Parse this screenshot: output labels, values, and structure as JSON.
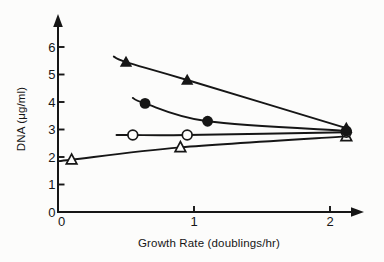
{
  "figure": {
    "background": "#fcfcfb",
    "ink": "#161616"
  },
  "chart_data": {
    "type": "line",
    "title": "",
    "xlabel": "Growth Rate (doublings/hr)",
    "ylabel": "DNA (μg/ml)",
    "xlim": [
      0,
      2.28
    ],
    "ylim": [
      0,
      6.9
    ],
    "x_ticks": [
      0,
      1,
      2
    ],
    "y_ticks": [
      0,
      1,
      2,
      3,
      4,
      5,
      6
    ],
    "grid": false,
    "legend": "none",
    "axis_arrows": true,
    "series": [
      {
        "name": "open-triangle",
        "marker": "triangle-open",
        "line_start": [
          0.0,
          1.85
        ],
        "points": [
          [
            0.1,
            1.9
          ],
          [
            0.9,
            2.35
          ],
          [
            2.12,
            2.75
          ]
        ]
      },
      {
        "name": "open-circle",
        "marker": "circle-open",
        "line_start": [
          0.43,
          2.8
        ],
        "points": [
          [
            0.55,
            2.8
          ],
          [
            0.95,
            2.8
          ],
          [
            2.12,
            2.9
          ]
        ]
      },
      {
        "name": "filled-circle",
        "marker": "circle-filled",
        "line_start": [
          0.55,
          4.15
        ],
        "points": [
          [
            0.64,
            3.95
          ],
          [
            1.1,
            3.3
          ],
          [
            2.12,
            2.95
          ]
        ]
      },
      {
        "name": "filled-triangle",
        "marker": "triangle-filled",
        "line_start": [
          0.41,
          5.65
        ],
        "points": [
          [
            0.5,
            5.45
          ],
          [
            0.95,
            4.8
          ],
          [
            2.12,
            3.05
          ]
        ]
      }
    ]
  }
}
